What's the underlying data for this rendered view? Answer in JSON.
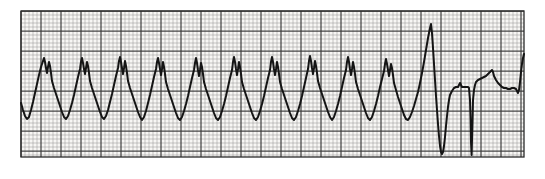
{
  "figure": {
    "kind": "ecg-rhythm-strip",
    "title": "",
    "caption": "",
    "width_px": 545,
    "height_px": 179,
    "background_color": "#ffffff"
  },
  "paper": {
    "label": "ecg-graph-paper",
    "left_px": 21,
    "top_px": 11,
    "right_px": 524,
    "bottom_px": 157,
    "paper_fill": "#f7f6f4",
    "small_box_px": 4,
    "large_box_px": 20,
    "minor_grid_color": "#9a9a9a",
    "major_grid_color": "#3c3c3c",
    "minor_grid_width": 0.7,
    "major_grid_width": 1.25,
    "minor_grid_opacity": 0.75,
    "major_grid_opacity": 0.95,
    "border_color": "#2a2a2a"
  },
  "trace": {
    "label": "ecg-waveform",
    "color": "#141414",
    "stroke_width": 2.0,
    "baseline_y_px": 96,
    "rhythm_segments": [
      {
        "name": "wide-complex-tachycardia",
        "description": "Regular wide sawtooth monomorphic complexes",
        "start_x_px": 21,
        "end_x_px": 432,
        "cycle_length_px": 27.5,
        "beat_count": 15,
        "peak_y_px": 57,
        "trough_y_px": 119
      },
      {
        "name": "conversion-beat",
        "description": "Tall narrow spike terminating tachycardia",
        "start_x_px": 432,
        "end_x_px": 452,
        "spike_peak_y_px": 24,
        "spike_trough_y_px": 154
      },
      {
        "name": "post-conversion-rhythm",
        "description": "Restored supraventricular beats with ST segment and T waves",
        "start_x_px": 452,
        "end_x_px": 524,
        "qrs_positions_px": [
          470,
          521
        ],
        "t_wave_peak_x_px": 492,
        "t_wave_peak_y_px": 78
      }
    ],
    "points": [
      [
        21,
        103
      ],
      [
        23,
        110
      ],
      [
        25,
        116
      ],
      [
        27,
        119
      ],
      [
        29,
        117
      ],
      [
        31,
        110
      ],
      [
        33,
        102
      ],
      [
        35,
        93
      ],
      [
        37,
        84
      ],
      [
        39,
        75
      ],
      [
        41,
        67
      ],
      [
        43,
        61
      ],
      [
        44,
        58
      ],
      [
        45,
        62
      ],
      [
        46,
        68
      ],
      [
        47,
        73
      ],
      [
        48,
        67
      ],
      [
        49,
        62
      ],
      [
        50,
        66
      ],
      [
        51,
        73
      ],
      [
        52,
        81
      ],
      [
        54,
        88
      ],
      [
        56,
        94
      ],
      [
        58,
        100
      ],
      [
        60,
        106
      ],
      [
        62,
        112
      ],
      [
        64,
        117
      ],
      [
        66,
        119
      ],
      [
        68,
        116
      ],
      [
        70,
        110
      ],
      [
        72,
        103
      ],
      [
        74,
        95
      ],
      [
        76,
        86
      ],
      [
        78,
        77
      ],
      [
        80,
        69
      ],
      [
        81,
        62
      ],
      [
        82,
        58
      ],
      [
        83,
        63
      ],
      [
        84,
        69
      ],
      [
        85,
        74
      ],
      [
        86,
        68
      ],
      [
        87,
        62
      ],
      [
        88,
        66
      ],
      [
        89,
        73
      ],
      [
        90,
        81
      ],
      [
        92,
        88
      ],
      [
        94,
        94
      ],
      [
        96,
        100
      ],
      [
        98,
        106
      ],
      [
        100,
        112
      ],
      [
        102,
        117
      ],
      [
        104,
        119
      ],
      [
        106,
        116
      ],
      [
        108,
        110
      ],
      [
        110,
        102
      ],
      [
        112,
        94
      ],
      [
        114,
        85
      ],
      [
        116,
        76
      ],
      [
        118,
        68
      ],
      [
        119,
        61
      ],
      [
        120,
        57
      ],
      [
        121,
        62
      ],
      [
        122,
        68
      ],
      [
        123,
        74
      ],
      [
        124,
        68
      ],
      [
        125,
        61
      ],
      [
        126,
        66
      ],
      [
        127,
        73
      ],
      [
        128,
        81
      ],
      [
        130,
        88
      ],
      [
        132,
        94
      ],
      [
        134,
        100
      ],
      [
        136,
        106
      ],
      [
        138,
        112
      ],
      [
        140,
        117
      ],
      [
        142,
        120
      ],
      [
        144,
        117
      ],
      [
        146,
        111
      ],
      [
        148,
        103
      ],
      [
        150,
        95
      ],
      [
        152,
        86
      ],
      [
        154,
        77
      ],
      [
        156,
        69
      ],
      [
        157,
        62
      ],
      [
        158,
        58
      ],
      [
        159,
        63
      ],
      [
        160,
        69
      ],
      [
        161,
        75
      ],
      [
        162,
        69
      ],
      [
        163,
        62
      ],
      [
        164,
        67
      ],
      [
        165,
        74
      ],
      [
        166,
        82
      ],
      [
        168,
        89
      ],
      [
        170,
        95
      ],
      [
        172,
        101
      ],
      [
        174,
        107
      ],
      [
        176,
        113
      ],
      [
        178,
        118
      ],
      [
        180,
        120
      ],
      [
        182,
        117
      ],
      [
        184,
        111
      ],
      [
        186,
        104
      ],
      [
        188,
        96
      ],
      [
        190,
        87
      ],
      [
        192,
        78
      ],
      [
        194,
        70
      ],
      [
        195,
        63
      ],
      [
        196,
        58
      ],
      [
        197,
        63
      ],
      [
        198,
        70
      ],
      [
        199,
        76
      ],
      [
        200,
        70
      ],
      [
        201,
        63
      ],
      [
        202,
        67
      ],
      [
        203,
        74
      ],
      [
        204,
        82
      ],
      [
        206,
        89
      ],
      [
        208,
        95
      ],
      [
        210,
        101
      ],
      [
        212,
        107
      ],
      [
        214,
        113
      ],
      [
        216,
        118
      ],
      [
        218,
        120
      ],
      [
        220,
        117
      ],
      [
        222,
        111
      ],
      [
        224,
        104
      ],
      [
        226,
        96
      ],
      [
        228,
        87
      ],
      [
        230,
        78
      ],
      [
        232,
        70
      ],
      [
        233,
        62
      ],
      [
        234,
        57
      ],
      [
        235,
        62
      ],
      [
        236,
        69
      ],
      [
        237,
        75
      ],
      [
        238,
        69
      ],
      [
        239,
        62
      ],
      [
        240,
        67
      ],
      [
        241,
        74
      ],
      [
        242,
        82
      ],
      [
        244,
        89
      ],
      [
        246,
        95
      ],
      [
        248,
        101
      ],
      [
        250,
        107
      ],
      [
        252,
        113
      ],
      [
        254,
        118
      ],
      [
        256,
        120
      ],
      [
        258,
        117
      ],
      [
        260,
        111
      ],
      [
        262,
        104
      ],
      [
        264,
        96
      ],
      [
        266,
        87
      ],
      [
        268,
        78
      ],
      [
        270,
        70
      ],
      [
        271,
        62
      ],
      [
        272,
        57
      ],
      [
        273,
        62
      ],
      [
        274,
        69
      ],
      [
        275,
        75
      ],
      [
        276,
        69
      ],
      [
        277,
        62
      ],
      [
        278,
        67
      ],
      [
        279,
        74
      ],
      [
        280,
        82
      ],
      [
        282,
        89
      ],
      [
        284,
        95
      ],
      [
        286,
        101
      ],
      [
        288,
        107
      ],
      [
        290,
        113
      ],
      [
        292,
        118
      ],
      [
        294,
        120
      ],
      [
        296,
        117
      ],
      [
        298,
        111
      ],
      [
        300,
        104
      ],
      [
        302,
        96
      ],
      [
        304,
        87
      ],
      [
        306,
        78
      ],
      [
        308,
        69
      ],
      [
        309,
        61
      ],
      [
        310,
        56
      ],
      [
        311,
        61
      ],
      [
        312,
        68
      ],
      [
        313,
        74
      ],
      [
        314,
        68
      ],
      [
        315,
        61
      ],
      [
        316,
        66
      ],
      [
        317,
        73
      ],
      [
        318,
        81
      ],
      [
        320,
        88
      ],
      [
        322,
        94
      ],
      [
        324,
        100
      ],
      [
        326,
        106
      ],
      [
        328,
        112
      ],
      [
        330,
        117
      ],
      [
        332,
        120
      ],
      [
        334,
        117
      ],
      [
        336,
        111
      ],
      [
        338,
        104
      ],
      [
        340,
        96
      ],
      [
        342,
        87
      ],
      [
        344,
        78
      ],
      [
        346,
        70
      ],
      [
        347,
        62
      ],
      [
        348,
        57
      ],
      [
        349,
        62
      ],
      [
        350,
        69
      ],
      [
        351,
        75
      ],
      [
        352,
        69
      ],
      [
        353,
        62
      ],
      [
        354,
        67
      ],
      [
        355,
        74
      ],
      [
        356,
        82
      ],
      [
        358,
        89
      ],
      [
        360,
        95
      ],
      [
        362,
        101
      ],
      [
        364,
        107
      ],
      [
        366,
        113
      ],
      [
        368,
        118
      ],
      [
        370,
        120
      ],
      [
        372,
        117
      ],
      [
        374,
        111
      ],
      [
        376,
        104
      ],
      [
        378,
        96
      ],
      [
        380,
        87
      ],
      [
        382,
        79
      ],
      [
        384,
        71
      ],
      [
        385,
        64
      ],
      [
        386,
        59
      ],
      [
        387,
        64
      ],
      [
        388,
        70
      ],
      [
        389,
        76
      ],
      [
        390,
        70
      ],
      [
        391,
        64
      ],
      [
        392,
        68
      ],
      [
        393,
        75
      ],
      [
        394,
        83
      ],
      [
        396,
        90
      ],
      [
        398,
        97
      ],
      [
        400,
        103
      ],
      [
        402,
        109
      ],
      [
        404,
        115
      ],
      [
        406,
        119
      ],
      [
        408,
        120
      ],
      [
        410,
        117
      ],
      [
        412,
        112
      ],
      [
        414,
        106
      ],
      [
        416,
        99
      ],
      [
        418,
        92
      ],
      [
        420,
        83
      ],
      [
        422,
        73
      ],
      [
        424,
        62
      ],
      [
        426,
        50
      ],
      [
        428,
        38
      ],
      [
        430,
        28
      ],
      [
        431,
        24
      ],
      [
        432,
        33
      ],
      [
        433,
        48
      ],
      [
        434,
        64
      ],
      [
        435,
        80
      ],
      [
        436,
        96
      ],
      [
        437,
        110
      ],
      [
        438,
        124
      ],
      [
        439,
        136
      ],
      [
        440,
        146
      ],
      [
        441,
        152
      ],
      [
        442,
        154
      ],
      [
        443,
        152
      ],
      [
        444,
        146
      ],
      [
        445,
        137
      ],
      [
        446,
        126
      ],
      [
        447,
        116
      ],
      [
        448,
        107
      ],
      [
        449,
        100
      ],
      [
        450,
        95
      ],
      [
        452,
        91
      ],
      [
        454,
        88
      ],
      [
        456,
        87
      ],
      [
        458,
        87
      ],
      [
        459,
        85
      ],
      [
        460,
        83
      ],
      [
        461,
        85
      ],
      [
        462,
        87
      ],
      [
        464,
        87
      ],
      [
        466,
        87
      ],
      [
        468,
        87
      ],
      [
        469,
        88
      ],
      [
        470,
        100
      ],
      [
        470.6,
        120
      ],
      [
        471,
        142
      ],
      [
        471.6,
        155
      ],
      [
        472,
        140
      ],
      [
        472.6,
        118
      ],
      [
        473,
        100
      ],
      [
        474,
        90
      ],
      [
        475,
        85
      ],
      [
        476,
        82
      ],
      [
        478,
        80
      ],
      [
        480,
        79
      ],
      [
        482,
        78
      ],
      [
        484,
        77
      ],
      [
        486,
        76
      ],
      [
        488,
        74
      ],
      [
        490,
        72
      ],
      [
        492,
        70
      ],
      [
        493,
        72
      ],
      [
        494,
        76
      ],
      [
        496,
        80
      ],
      [
        498,
        83
      ],
      [
        500,
        85
      ],
      [
        502,
        87
      ],
      [
        504,
        88
      ],
      [
        506,
        88
      ],
      [
        508,
        89
      ],
      [
        510,
        89
      ],
      [
        512,
        88
      ],
      [
        514,
        88
      ],
      [
        516,
        89
      ],
      [
        517,
        91
      ],
      [
        518,
        93
      ],
      [
        519,
        90
      ],
      [
        520,
        82
      ],
      [
        521,
        72
      ],
      [
        522,
        64
      ],
      [
        523,
        58
      ],
      [
        524,
        54
      ]
    ]
  }
}
